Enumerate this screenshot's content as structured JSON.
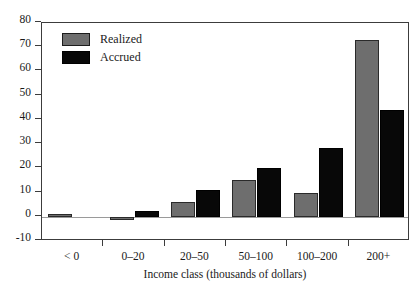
{
  "chart_data": {
    "type": "bar",
    "title": "",
    "subtitle": "",
    "xlabel": "Income class (thousands of dollars)",
    "ylabel": "",
    "categories": [
      "< 0",
      "0–20",
      "20–50",
      "50–100",
      "100–200",
      "200+"
    ],
    "series": [
      {
        "name": "Realized",
        "color": "#6e6e6e",
        "values": [
          1,
          -1.5,
          6,
          15,
          10,
          73
        ]
      },
      {
        "name": "Accrued",
        "color": "#080808",
        "values": [
          0,
          2.5,
          11,
          20,
          28.5,
          44
        ]
      }
    ],
    "ylim": [
      -10,
      80
    ],
    "ytick_values": [
      -10,
      0,
      10,
      20,
      30,
      40,
      50,
      60,
      70,
      80
    ],
    "ytick_labels": [
      "-10",
      "0",
      "10",
      "20",
      "30",
      "40",
      "50",
      "60",
      "70",
      "80"
    ],
    "grid": false,
    "legend_position": "upper left",
    "frame": true,
    "zero_line": true
  },
  "legend": {
    "entries": [
      {
        "label": "Realized"
      },
      {
        "label": "Accrued"
      }
    ]
  },
  "axis": {
    "x_title": "Income class (thousands of dollars)"
  }
}
